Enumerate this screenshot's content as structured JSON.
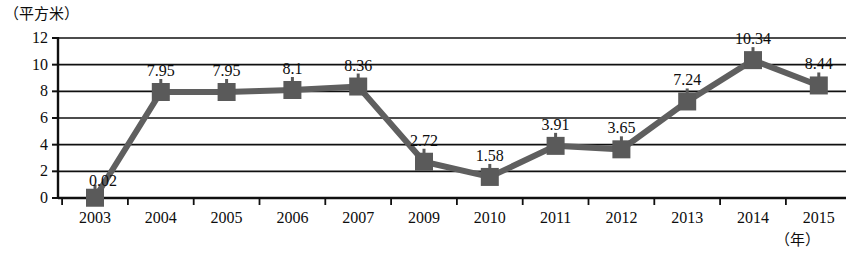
{
  "chart_data": {
    "type": "line",
    "title": "",
    "subtitle": "",
    "xlabel": "（年）",
    "ylabel": "（平方米）",
    "ylim": [
      0,
      12
    ],
    "yticks": [
      "0",
      "2",
      "4",
      "6",
      "8",
      "10",
      "12"
    ],
    "grid": true,
    "legend": null,
    "categories": [
      "2003",
      "2004",
      "2005",
      "2006",
      "2007",
      "2009",
      "2010",
      "2011",
      "2012",
      "2013",
      "2014",
      "2015"
    ],
    "values": [
      0.02,
      7.95,
      7.95,
      8.1,
      8.36,
      2.72,
      1.58,
      3.91,
      3.65,
      7.24,
      10.34,
      8.44
    ],
    "point_labels": [
      "0.02",
      "7.95",
      "7.95",
      "8.1",
      "8.36",
      "2.72",
      "1.58",
      "3.91",
      "3.65",
      "7.24",
      "10.34",
      "8.44"
    ],
    "series": [
      {
        "name": "",
        "values": [
          0.02,
          7.95,
          7.95,
          8.1,
          8.36,
          2.72,
          1.58,
          3.91,
          3.65,
          7.24,
          10.34,
          8.44
        ]
      }
    ],
    "colors": {
      "line": "#5f5f5f",
      "marker": "#5a5a5a",
      "axis": "#101010",
      "grid": "#101010",
      "text": "#0d0d0d",
      "background": "#ffffff"
    }
  }
}
